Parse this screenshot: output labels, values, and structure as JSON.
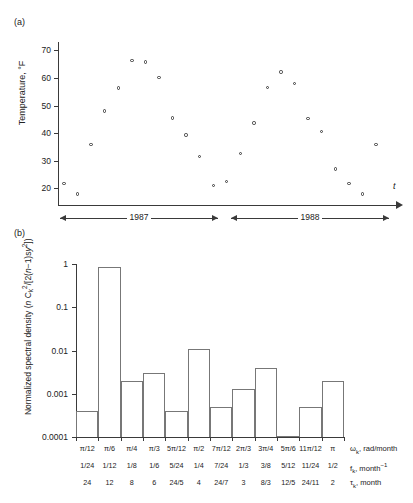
{
  "panel_a": {
    "tag": "(a)",
    "ylabel": "Temperature, °F",
    "xlabel": "t",
    "yticks": [
      "70",
      "60",
      "50",
      "40",
      "30",
      "20"
    ],
    "year_spans": [
      {
        "label": "1987"
      },
      {
        "label": "1988"
      }
    ]
  },
  "panel_b": {
    "tag": "(b)",
    "yticks": [
      "1",
      "0.1",
      "0.01",
      "0.001",
      "0.0001"
    ],
    "row_names": {
      "omega": "ω",
      "omega_sub": "k",
      "omega_unit": ", rad/month",
      "f": "f",
      "f_sub": "k",
      "f_unit": ", month",
      "f_exp": "−1",
      "tau": "τ",
      "tau_sub": "k",
      "tau_unit": ", month"
    }
  },
  "chart_data": [
    {
      "type": "scatter",
      "title": "(a) Monthly mean temperature time series",
      "xlabel": "t",
      "ylabel": "Temperature, °F",
      "ylim": [
        14,
        73
      ],
      "yticks": [
        20,
        30,
        40,
        50,
        60,
        70
      ],
      "grid": false,
      "x_note": "24 consecutive months, Jan 1987 – Dec 1988",
      "x": [
        1,
        2,
        3,
        4,
        5,
        6,
        7,
        8,
        9,
        10,
        11,
        12,
        13,
        14,
        15,
        16,
        17,
        18,
        19,
        20,
        21,
        22,
        23,
        24
      ],
      "values": [
        21.8,
        18.0,
        36.0,
        48.0,
        56.3,
        66.3,
        65.8,
        60.2,
        45.5,
        39.3,
        31.6,
        21.0,
        22.4,
        32.7,
        43.7,
        56.6,
        62.1,
        57.9,
        45.3,
        40.6,
        27.0,
        21.8,
        18.0,
        36.0
      ],
      "x_group_labels": [
        "1987",
        "1988"
      ]
    },
    {
      "type": "bar",
      "title": "(b) Normalized spectral density",
      "ylabel": "Normalized spectral density (n Ck²/[2(n−1)sy²])",
      "yscale": "log",
      "ylim": [
        0.0001,
        1
      ],
      "yticks": [
        0.0001,
        0.001,
        0.01,
        0.1,
        1
      ],
      "grid": false,
      "categories": [
        "π/12",
        "π/6",
        "π/4",
        "π/3",
        "5π/12",
        "π/2",
        "7π/12",
        "2π/3",
        "3π/4",
        "5π/6",
        "11π/12",
        "π"
      ],
      "categories_f": [
        "1/24",
        "1/12",
        "1/8",
        "1/6",
        "5/24",
        "1/4",
        "7/24",
        "1/3",
        "3/8",
        "5/12",
        "11/24",
        "1/2"
      ],
      "categories_tau": [
        "24",
        "12",
        "8",
        "6",
        "24/5",
        "4",
        "24/7",
        "3",
        "8/3",
        "12/5",
        "24/11",
        "2"
      ],
      "values": [
        0.0004,
        0.85,
        0.002,
        0.003,
        0.0004,
        0.011,
        0.0005,
        0.0013,
        0.004,
        0.000105,
        0.0005,
        0.002
      ]
    }
  ]
}
